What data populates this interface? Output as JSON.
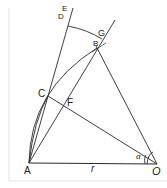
{
  "diagram": {
    "type": "geometric-construction",
    "colors": {
      "stroke": "#2a2a2a",
      "border": "#d8d8d8",
      "background": "#ffffff"
    },
    "points": {
      "A": {
        "label": "A",
        "x": 29,
        "y": 163
      },
      "O": {
        "label": "O",
        "x": 157,
        "y": 164
      },
      "B": {
        "label": "B",
        "x": 97,
        "y": 48
      },
      "G": {
        "label": "G",
        "x": 102,
        "y": 39
      },
      "C": {
        "label": "C",
        "x": 48,
        "y": 96
      },
      "F": {
        "label": "F",
        "x": 64,
        "y": 106
      },
      "E": {
        "label": "E",
        "x": 69,
        "y": 22
      },
      "D": {
        "label": "D",
        "x": 68,
        "y": 27
      }
    },
    "annotations": {
      "radius_label": "r",
      "angle_label": "α"
    }
  }
}
